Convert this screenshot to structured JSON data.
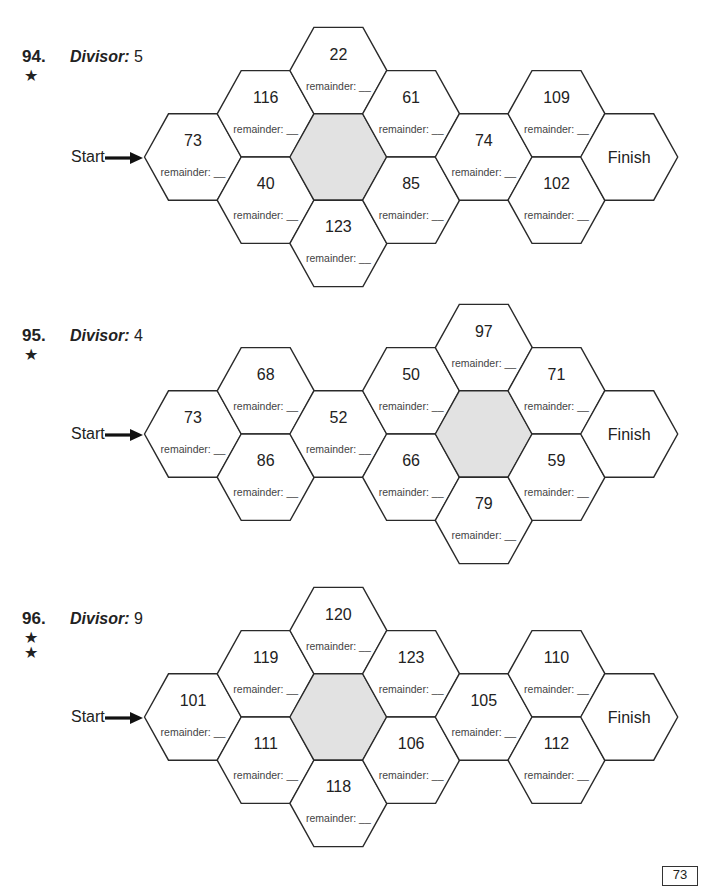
{
  "labels": {
    "divisor": "Divisor:",
    "start": "Start",
    "finish": "Finish",
    "remainder": "remainder: __"
  },
  "puzzles": [
    {
      "number": "94.",
      "stars": "★",
      "divisor": "5",
      "top": 0,
      "center_y": 157,
      "cells": [
        {
          "col": 0,
          "row": 0,
          "value": "73"
        },
        {
          "col": 1,
          "row": -1,
          "value": "116"
        },
        {
          "col": 1,
          "row": 1,
          "value": "40"
        },
        {
          "col": 2,
          "row": -2,
          "value": "22"
        },
        {
          "col": 2,
          "row": 0,
          "value": "",
          "shaded": true
        },
        {
          "col": 2,
          "row": 2,
          "value": "123"
        },
        {
          "col": 3,
          "row": -1,
          "value": "61"
        },
        {
          "col": 3,
          "row": 1,
          "value": "85"
        },
        {
          "col": 4,
          "row": 0,
          "value": "74"
        },
        {
          "col": 5,
          "row": -1,
          "value": "109"
        },
        {
          "col": 5,
          "row": 1,
          "value": "102"
        },
        {
          "col": 6,
          "row": 0,
          "value": "Finish",
          "finish": true
        }
      ]
    },
    {
      "number": "95.",
      "stars": "★",
      "divisor": "4",
      "top": 0,
      "center_y": 434,
      "cells": [
        {
          "col": 0,
          "row": 0,
          "value": "73"
        },
        {
          "col": 1,
          "row": -1,
          "value": "68"
        },
        {
          "col": 1,
          "row": 1,
          "value": "86"
        },
        {
          "col": 2,
          "row": 0,
          "value": "52"
        },
        {
          "col": 3,
          "row": -1,
          "value": "50"
        },
        {
          "col": 3,
          "row": 1,
          "value": "66"
        },
        {
          "col": 4,
          "row": -2,
          "value": "97"
        },
        {
          "col": 4,
          "row": 0,
          "value": "",
          "shaded": true
        },
        {
          "col": 4,
          "row": 2,
          "value": "79"
        },
        {
          "col": 5,
          "row": -1,
          "value": "71"
        },
        {
          "col": 5,
          "row": 1,
          "value": "59"
        },
        {
          "col": 6,
          "row": 0,
          "value": "Finish",
          "finish": true
        }
      ]
    },
    {
      "number": "96.",
      "stars": "★\n★",
      "divisor": "9",
      "top": 0,
      "center_y": 717,
      "cells": [
        {
          "col": 0,
          "row": 0,
          "value": "101"
        },
        {
          "col": 1,
          "row": -1,
          "value": "119"
        },
        {
          "col": 1,
          "row": 1,
          "value": "111"
        },
        {
          "col": 2,
          "row": -2,
          "value": "120"
        },
        {
          "col": 2,
          "row": 0,
          "value": "",
          "shaded": true
        },
        {
          "col": 2,
          "row": 2,
          "value": "118"
        },
        {
          "col": 3,
          "row": -1,
          "value": "123"
        },
        {
          "col": 3,
          "row": 1,
          "value": "106"
        },
        {
          "col": 4,
          "row": 0,
          "value": "105"
        },
        {
          "col": 5,
          "row": -1,
          "value": "110"
        },
        {
          "col": 5,
          "row": 1,
          "value": "112"
        },
        {
          "col": 6,
          "row": 0,
          "value": "Finish",
          "finish": true
        }
      ]
    }
  ],
  "page_number": "73"
}
